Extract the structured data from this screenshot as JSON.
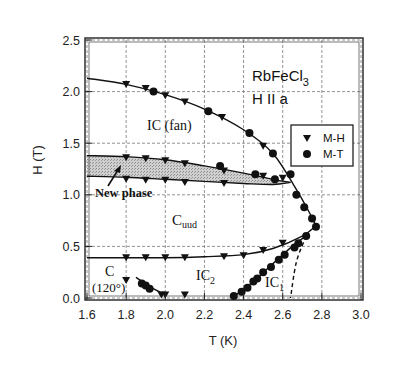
{
  "chart_data": {
    "type": "scatter",
    "title": "",
    "xlabel": "T (K)",
    "ylabel": "H (T)",
    "xlim": [
      1.6,
      3.0
    ],
    "ylim": [
      0.0,
      2.5
    ],
    "xticks": [
      "1.6",
      "1.8",
      "2.0",
      "2.2",
      "2.4",
      "2.6",
      "2.8",
      "3.0"
    ],
    "yticks": [
      "0.0",
      "0.5",
      "1.0",
      "1.5",
      "2.0",
      "2.5"
    ],
    "grid": true,
    "legend_position": "upper-right-inside",
    "annotations": {
      "compound": "RbFeCl",
      "compound_sub": "3",
      "field_dir": "H II a",
      "ic_fan": "IC (fan)",
      "new_phase": "New phase",
      "cuud": "C",
      "cuud_sub": "uud",
      "c120_a": "C",
      "c120_b": "(120°)",
      "ic2": "IC",
      "ic2_sub": "2",
      "ic1": "IC",
      "ic1_sub": "1"
    },
    "series": [
      {
        "name": "M-H",
        "marker": "triangle-down",
        "points": [
          [
            1.8,
            2.07
          ],
          [
            1.9,
            2.03
          ],
          [
            2.0,
            1.96
          ],
          [
            2.1,
            1.9
          ],
          [
            2.29,
            1.75
          ],
          [
            2.5,
            1.47
          ],
          [
            1.8,
            1.36
          ],
          [
            1.9,
            1.35
          ],
          [
            2.0,
            1.33
          ],
          [
            2.1,
            1.3
          ],
          [
            2.3,
            1.23
          ],
          [
            2.5,
            1.18
          ],
          [
            2.6,
            1.16
          ],
          [
            1.8,
            1.15
          ],
          [
            1.9,
            1.14
          ],
          [
            2.0,
            1.14
          ],
          [
            2.1,
            1.12
          ],
          [
            2.3,
            1.11
          ],
          [
            1.8,
            0.39
          ],
          [
            1.9,
            0.39
          ],
          [
            2.0,
            0.39
          ],
          [
            2.1,
            0.39
          ],
          [
            2.3,
            0.4
          ],
          [
            2.4,
            0.41
          ],
          [
            2.5,
            0.46
          ],
          [
            2.6,
            0.53
          ],
          [
            1.8,
            0.17
          ],
          [
            1.98,
            0.03
          ],
          [
            2.0,
            0.03
          ],
          [
            2.1,
            0.03
          ]
        ]
      },
      {
        "name": "M-T",
        "marker": "circle",
        "points": [
          [
            1.94,
            2.0
          ],
          [
            2.22,
            1.81
          ],
          [
            2.43,
            1.6
          ],
          [
            2.55,
            1.4
          ],
          [
            2.64,
            1.2
          ],
          [
            2.28,
            1.28
          ],
          [
            2.46,
            1.2
          ],
          [
            2.56,
            1.15
          ],
          [
            2.67,
            1.0
          ],
          [
            2.71,
            0.88
          ],
          [
            2.75,
            0.77
          ],
          [
            2.77,
            0.69
          ],
          [
            2.72,
            0.6
          ],
          [
            2.68,
            0.53
          ],
          [
            2.66,
            0.49
          ],
          [
            2.61,
            0.42
          ],
          [
            2.58,
            0.37
          ],
          [
            2.54,
            0.3
          ],
          [
            2.5,
            0.25
          ],
          [
            2.47,
            0.19
          ],
          [
            2.45,
            0.16
          ],
          [
            2.42,
            0.1
          ],
          [
            2.39,
            0.06
          ],
          [
            2.35,
            0.02
          ],
          [
            1.88,
            0.14
          ],
          [
            1.9,
            0.12
          ],
          [
            1.92,
            0.09
          ]
        ]
      }
    ],
    "boundaries": [
      {
        "name": "IC(fan) upper boundary",
        "style": "solid",
        "points": [
          [
            1.6,
            2.13
          ],
          [
            1.8,
            2.07
          ],
          [
            2.0,
            1.97
          ],
          [
            2.2,
            1.83
          ],
          [
            2.4,
            1.63
          ],
          [
            2.55,
            1.4
          ],
          [
            2.67,
            1.05
          ],
          [
            2.73,
            0.85
          ],
          [
            2.77,
            0.7
          ]
        ]
      },
      {
        "name": "New phase upper",
        "style": "solid",
        "points": [
          [
            1.6,
            1.38
          ],
          [
            1.8,
            1.37
          ],
          [
            2.0,
            1.34
          ],
          [
            2.2,
            1.28
          ],
          [
            2.4,
            1.21
          ],
          [
            2.55,
            1.15
          ],
          [
            2.64,
            1.12
          ]
        ]
      },
      {
        "name": "New phase lower",
        "style": "solid",
        "points": [
          [
            1.6,
            1.18
          ],
          [
            1.8,
            1.17
          ],
          [
            2.0,
            1.15
          ],
          [
            2.2,
            1.13
          ],
          [
            2.4,
            1.11
          ],
          [
            2.55,
            1.1
          ],
          [
            2.64,
            1.12
          ]
        ]
      },
      {
        "name": "Cuud lower boundary",
        "style": "solid",
        "points": [
          [
            1.6,
            0.39
          ],
          [
            1.8,
            0.39
          ],
          [
            2.0,
            0.39
          ],
          [
            2.2,
            0.4
          ],
          [
            2.4,
            0.42
          ],
          [
            2.55,
            0.48
          ],
          [
            2.7,
            0.6
          ],
          [
            2.77,
            0.7
          ]
        ]
      },
      {
        "name": "IC1 boundary",
        "style": "solid",
        "points": [
          [
            2.34,
            0.0
          ],
          [
            2.45,
            0.16
          ],
          [
            2.56,
            0.35
          ],
          [
            2.66,
            0.52
          ],
          [
            2.72,
            0.6
          ]
        ]
      },
      {
        "name": "IC1 dashed",
        "style": "dashed",
        "points": [
          [
            2.72,
            0.6
          ],
          [
            2.67,
            0.35
          ],
          [
            2.64,
            0.0
          ]
        ]
      },
      {
        "name": "C(120) boundary",
        "style": "solid",
        "points": [
          [
            1.85,
            0.2
          ],
          [
            1.93,
            0.1
          ],
          [
            2.0,
            0.03
          ]
        ]
      }
    ]
  }
}
